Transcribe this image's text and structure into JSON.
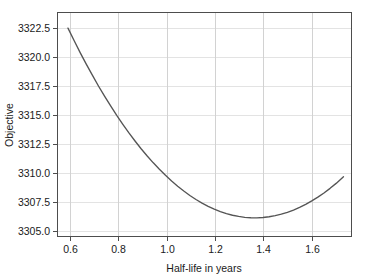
{
  "figure": {
    "background_color": "#ffffff",
    "plot_area": {
      "left": 57,
      "top": 12,
      "right": 352,
      "bottom": 237
    }
  },
  "chart_data": {
    "type": "line",
    "title": "",
    "subtitle": "",
    "xlabel": "Half-life in years",
    "ylabel": "Objective",
    "xlim": [
      0.555,
      1.765
    ],
    "ylim": [
      3303.6,
      3324.5
    ],
    "xticks": [
      0.6,
      0.8,
      1.0,
      1.2,
      1.4,
      1.6
    ],
    "xticklabels": [
      "0.6",
      "0.8",
      "1.0",
      "1.2",
      "1.4",
      "1.6"
    ],
    "yticks": [
      3305.0,
      3307.5,
      3310.0,
      3312.5,
      3315.0,
      3317.5,
      3320.0,
      3322.5
    ],
    "yticklabels": [
      "3305.0",
      "3307.5",
      "3310.0",
      "3312.5",
      "3315.0",
      "3317.5",
      "3320.0",
      "3322.5"
    ],
    "grid": true,
    "grid_color": "#e3e3e3",
    "legend": null,
    "annotations": [],
    "series": [
      {
        "name": "objective",
        "color": "#555555",
        "linewidth": 1.35,
        "x": [
          0.6,
          0.625,
          0.65,
          0.675,
          0.7,
          0.725,
          0.75,
          0.775,
          0.8,
          0.825,
          0.85,
          0.875,
          0.9,
          0.925,
          0.95,
          0.975,
          1.0,
          1.025,
          1.05,
          1.075,
          1.1,
          1.125,
          1.15,
          1.175,
          1.2,
          1.225,
          1.25,
          1.275,
          1.3,
          1.325,
          1.35,
          1.375,
          1.4,
          1.425,
          1.45,
          1.475,
          1.5,
          1.525,
          1.55,
          1.575,
          1.6,
          1.625,
          1.65,
          1.675,
          1.7,
          1.73
        ],
        "y": [
          3323.0,
          3321.85,
          3320.73,
          3319.66,
          3318.63,
          3317.63,
          3316.68,
          3315.77,
          3314.9,
          3314.07,
          3313.27,
          3312.52,
          3311.8,
          3311.13,
          3310.49,
          3309.89,
          3309.33,
          3308.8,
          3308.32,
          3307.87,
          3307.46,
          3307.08,
          3306.75,
          3306.45,
          3306.19,
          3305.96,
          3305.78,
          3305.62,
          3305.51,
          3305.43,
          3305.39,
          3305.38,
          3305.41,
          3305.48,
          3305.58,
          3305.72,
          3305.89,
          3306.1,
          3306.35,
          3306.63,
          3306.95,
          3307.3,
          3307.69,
          3308.12,
          3308.58,
          3309.2
        ],
        "minimum": {
          "x": 1.18,
          "y": 3305.1
        },
        "endpoints": {
          "start": [
            0.6,
            3323.0
          ],
          "end": [
            1.73,
            3311.4
          ]
        }
      }
    ]
  }
}
